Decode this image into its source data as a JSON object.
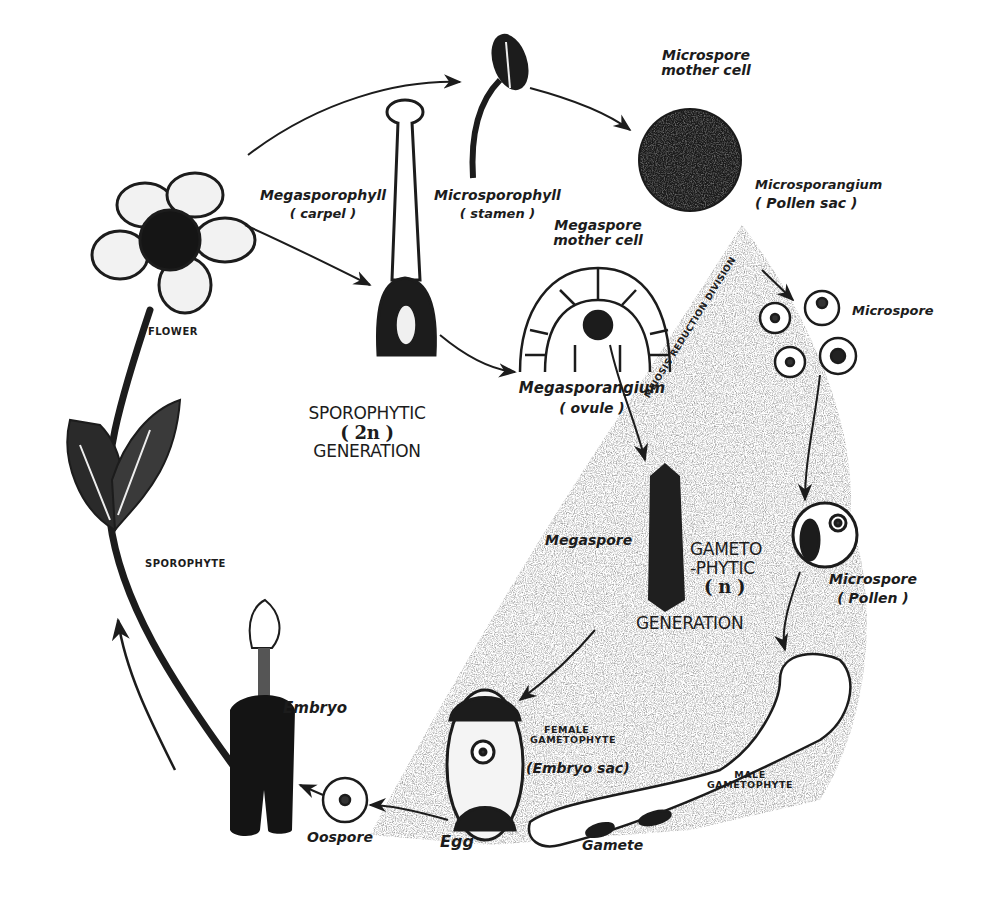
{
  "diagram": {
    "type": "life-cycle",
    "colors": {
      "ink": "#1c1c1c",
      "stipple": "#9a9a9a",
      "background": "#ffffff"
    },
    "generations": {
      "sporophytic": {
        "line1": "SPOROPHYTIC",
        "line2": "( 2n )",
        "line3": "GENERATION"
      },
      "gametophytic": {
        "line1": "GAMETO",
        "line2": "-PHYTIC",
        "line3": "( n )",
        "line4": "GENERATION"
      }
    },
    "labels": {
      "flower": "FLOWER",
      "sporophyte": "SPOROPHYTE",
      "megasporophyll": "Megasporophyll",
      "carpel": "( carpel )",
      "microsporophyll": "Microsporophyll",
      "stamen": "( stamen )",
      "microspore_mother_cell_1": "Microspore",
      "microspore_mother_cell_2": "mother cell",
      "microsporangium": "Microsporangium",
      "pollen_sac": "( Pollen sac )",
      "megaspore_mother_cell_1": "Megaspore",
      "megaspore_mother_cell_2": "mother cell",
      "meiosis": "MEIOSIS REDUCTION DIVISION",
      "microspore": "Microspore",
      "megasporangium": "Megasporangium",
      "ovule": "( ovule )",
      "megaspore": "Megaspore",
      "microspore_pollen_1": "Microspore",
      "microspore_pollen_2": "( Pollen )",
      "female_gametophyte_1": "FEMALE",
      "female_gametophyte_2": "GAMETOPHYTE",
      "embryo_sac": "(Embryo sac)",
      "male_gametophyte_1": "MALE",
      "male_gametophyte_2": "GAMETOPHYTE",
      "embryo": "Embryo",
      "oospore": "Oospore",
      "egg": "Egg",
      "gamete": "Gamete"
    }
  }
}
